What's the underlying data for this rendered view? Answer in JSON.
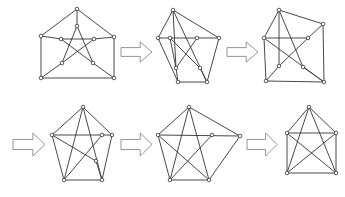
{
  "diagram": {
    "colors": {
      "edge": "#333333",
      "node_fill": "#ffffff",
      "node_stroke": "#333333",
      "arrow_stroke": "#8a8a8a"
    },
    "graphs": [
      {
        "id": "graph-1",
        "nodes": [
          [
            77,
            9
          ],
          [
            41,
            36
          ],
          [
            114,
            37
          ],
          [
            41,
            78
          ],
          [
            114,
            78
          ],
          [
            77,
            26
          ],
          [
            61,
            39
          ],
          [
            94,
            39
          ],
          [
            62,
            63
          ],
          [
            93,
            63
          ]
        ],
        "edges": [
          [
            0,
            1
          ],
          [
            0,
            2
          ],
          [
            1,
            3
          ],
          [
            2,
            4
          ],
          [
            3,
            4
          ],
          [
            0,
            5
          ],
          [
            1,
            6
          ],
          [
            2,
            7
          ],
          [
            3,
            8
          ],
          [
            4,
            9
          ],
          [
            5,
            8
          ],
          [
            5,
            9
          ],
          [
            6,
            7
          ],
          [
            6,
            9
          ],
          [
            7,
            8
          ]
        ]
      },
      {
        "id": "graph-2",
        "nodes": [
          [
            173,
            10
          ],
          [
            158,
            38
          ],
          [
            170,
            38
          ],
          [
            197,
            38
          ],
          [
            219,
            38
          ],
          [
            176,
            68
          ],
          [
            200,
            68
          ],
          [
            178,
            82
          ],
          [
            207,
            82
          ]
        ],
        "edges": [
          [
            0,
            1
          ],
          [
            0,
            4
          ],
          [
            0,
            5
          ],
          [
            0,
            8
          ],
          [
            1,
            3
          ],
          [
            3,
            4
          ],
          [
            1,
            7
          ],
          [
            4,
            8
          ],
          [
            7,
            8
          ],
          [
            3,
            5
          ],
          [
            2,
            6
          ],
          [
            2,
            5
          ],
          [
            5,
            7
          ],
          [
            6,
            8
          ]
        ]
      },
      {
        "id": "graph-3",
        "nodes": [
          [
            279,
            10
          ],
          [
            323,
            24
          ],
          [
            264,
            38
          ],
          [
            308,
            38
          ],
          [
            279,
            66
          ],
          [
            303,
            67
          ],
          [
            266,
            81
          ],
          [
            324,
            82
          ]
        ],
        "edges": [
          [
            0,
            1
          ],
          [
            0,
            2
          ],
          [
            0,
            4
          ],
          [
            0,
            5
          ],
          [
            1,
            7
          ],
          [
            1,
            3
          ],
          [
            2,
            3
          ],
          [
            2,
            6
          ],
          [
            2,
            7
          ],
          [
            3,
            4
          ],
          [
            4,
            6
          ],
          [
            6,
            7
          ],
          [
            5,
            7
          ]
        ]
      },
      {
        "id": "graph-4",
        "nodes": [
          [
            83,
            107
          ],
          [
            52,
            135
          ],
          [
            102,
            135
          ],
          [
            112,
            135
          ],
          [
            96,
            161
          ],
          [
            64,
            180
          ],
          [
            102,
            180
          ]
        ],
        "edges": [
          [
            0,
            1
          ],
          [
            0,
            3
          ],
          [
            0,
            5
          ],
          [
            0,
            6
          ],
          [
            1,
            3
          ],
          [
            1,
            4
          ],
          [
            1,
            5
          ],
          [
            3,
            6
          ],
          [
            5,
            6
          ],
          [
            2,
            5
          ],
          [
            4,
            6
          ]
        ]
      },
      {
        "id": "graph-5",
        "nodes": [
          [
            189,
            107
          ],
          [
            158,
            135
          ],
          [
            212,
            135
          ],
          [
            240,
            136
          ],
          [
            170,
            180
          ],
          [
            209,
            180
          ]
        ],
        "edges": [
          [
            0,
            1
          ],
          [
            0,
            3
          ],
          [
            0,
            4
          ],
          [
            0,
            5
          ],
          [
            1,
            3
          ],
          [
            1,
            4
          ],
          [
            1,
            5
          ],
          [
            2,
            4
          ],
          [
            3,
            5
          ],
          [
            4,
            5
          ]
        ]
      },
      {
        "id": "graph-6",
        "nodes": [
          [
            309,
            107
          ],
          [
            287,
            133
          ],
          [
            336,
            133
          ],
          [
            287,
            173
          ],
          [
            336,
            173
          ]
        ],
        "edges": [
          [
            0,
            1
          ],
          [
            0,
            2
          ],
          [
            0,
            3
          ],
          [
            0,
            4
          ],
          [
            1,
            2
          ],
          [
            1,
            3
          ],
          [
            1,
            4
          ],
          [
            2,
            3
          ],
          [
            2,
            4
          ],
          [
            3,
            4
          ]
        ]
      }
    ],
    "arrows": [
      {
        "id": "arrow-1",
        "x": 121,
        "y": 42,
        "w": 31,
        "h": 20
      },
      {
        "id": "arrow-2",
        "x": 227,
        "y": 42,
        "w": 31,
        "h": 20
      },
      {
        "id": "arrow-3",
        "x": 13,
        "y": 133,
        "w": 32,
        "h": 23
      },
      {
        "id": "arrow-4",
        "x": 121,
        "y": 133,
        "w": 31,
        "h": 23
      },
      {
        "id": "arrow-5",
        "x": 247,
        "y": 133,
        "w": 30,
        "h": 23
      }
    ]
  }
}
